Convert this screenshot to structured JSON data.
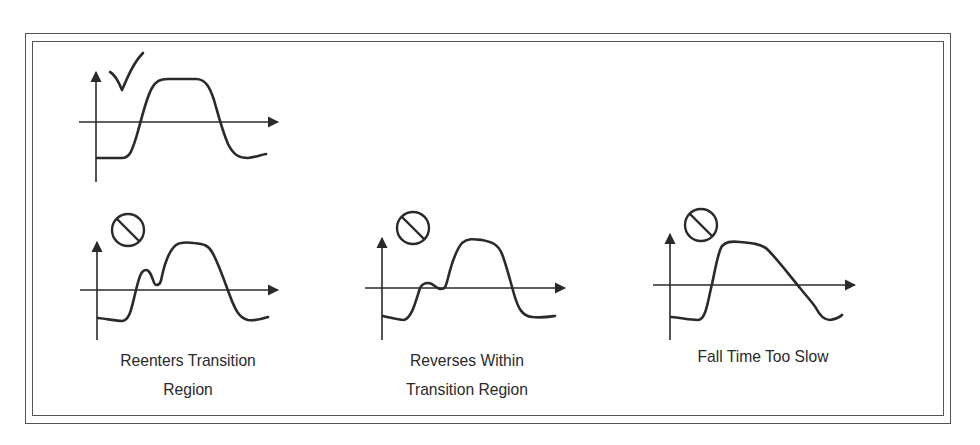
{
  "figure": {
    "frame": "double-rule border",
    "stroke_color": "#2a2a2a",
    "frame_color": "#555555"
  },
  "panels": [
    {
      "id": "good",
      "status": "correct",
      "status_icon": "checkmark-icon",
      "caption_lines": []
    },
    {
      "id": "reenters",
      "status": "prohibited",
      "status_icon": "prohibited-icon",
      "caption_lines": [
        "Reenters Transition",
        "Region"
      ]
    },
    {
      "id": "reverses",
      "status": "prohibited",
      "status_icon": "prohibited-icon",
      "caption_lines": [
        "Reverses Within",
        "Transition Region"
      ]
    },
    {
      "id": "fall-slow",
      "status": "prohibited",
      "status_icon": "prohibited-icon",
      "caption_lines": [
        "Fall Time Too Slow"
      ]
    }
  ]
}
